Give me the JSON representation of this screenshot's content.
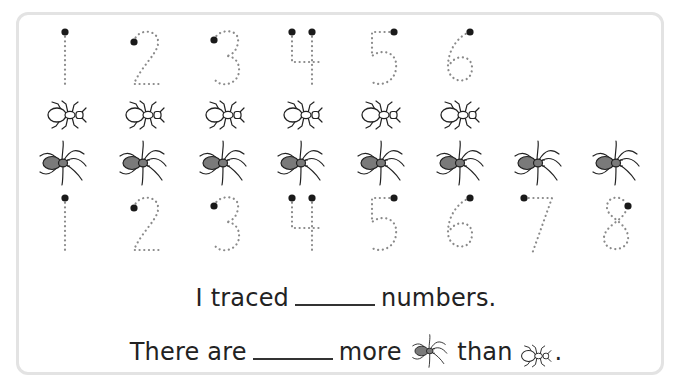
{
  "worksheet": {
    "top_digits": [
      "1",
      "2",
      "3",
      "4",
      "5",
      "6"
    ],
    "ant_count": 6,
    "spider_count": 8,
    "bottom_digits": [
      "1",
      "2",
      "3",
      "4",
      "5",
      "6",
      "7",
      "8"
    ],
    "sentence1": {
      "before": "I traced",
      "blank": "",
      "after": "numbers."
    },
    "sentence2": {
      "before": "There are",
      "blank": "",
      "middle": "more",
      "icon1": "spider-icon",
      "between": "than",
      "icon2": "ant-icon",
      "end": "."
    },
    "colors": {
      "frame": "#e3e3e3",
      "dots": "#8a8a8a",
      "start_dot": "#1a1a1a",
      "spider_body": "#7a7a7a",
      "ink": "#222222"
    }
  }
}
